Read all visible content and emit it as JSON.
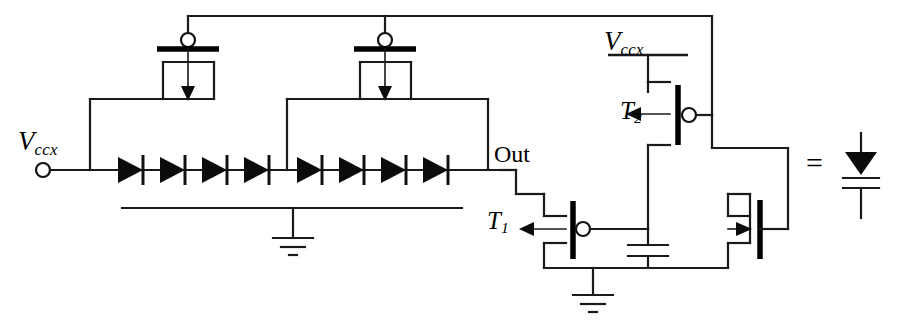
{
  "figure": {
    "kind": "circuit-schematic"
  },
  "labels": {
    "vccx_left": {
      "base": "V",
      "sub": "ccx"
    },
    "vccx_right": {
      "base": "V",
      "sub": "ccx"
    },
    "out": "Out",
    "t1": {
      "base": "T",
      "sub": "1"
    },
    "t2": {
      "base": "T",
      "sub": "2"
    },
    "equals": "="
  },
  "components": {
    "diode_chain": {
      "name": "series-diode-chain",
      "count": 8,
      "orientation": "left-to-right",
      "y": 170,
      "x_start": 148,
      "x_end": 476,
      "tap_x": 287
    },
    "pmos_top": [
      {
        "name": "pmos-left",
        "gate_x": 188,
        "body_arrow": "down"
      },
      {
        "name": "pmos-right",
        "gate_x": 385,
        "body_arrow": "down"
      }
    ],
    "transistors": [
      {
        "id": "T1",
        "type": "pmos",
        "arrow": "left",
        "bubble": true
      },
      {
        "id": "T2",
        "type": "pmos",
        "arrow": "left",
        "bubble": true
      },
      {
        "id": "Mdiode",
        "type": "nmos",
        "arrow": "right",
        "bubble": false,
        "diode_connected": true
      }
    ],
    "capacitor": {
      "name": "gate-capacitor",
      "orientation": "vertical",
      "plates": 2
    },
    "grounds": [
      {
        "name": "ground-left",
        "x": 293,
        "y": 208
      },
      {
        "name": "ground-right",
        "x": 593,
        "y": 272
      }
    ],
    "supply_rails": [
      {
        "name": "vccx-rail-right",
        "x1": 608,
        "x2": 688,
        "y": 55
      }
    ],
    "terminals": [
      {
        "name": "vccx-input-terminal",
        "x": 43,
        "y": 170
      }
    ],
    "legend": {
      "name": "equivalence-legend",
      "symbol": "diode",
      "text": "=",
      "note": "diode-connected NMOS equals diode symbol"
    }
  },
  "colors": {
    "wire": "#1a1a1a",
    "fill": "#0b0b0b",
    "background": "#ffffff"
  }
}
